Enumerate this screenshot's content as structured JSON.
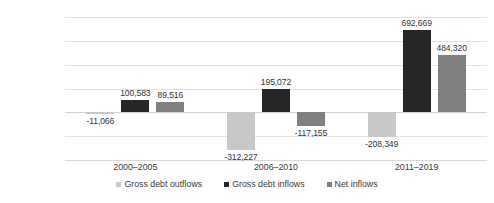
{
  "chart_data": {
    "type": "bar",
    "title": "",
    "subtitle": "",
    "xlabel": "",
    "ylabel": "",
    "categories": [
      "2000–2005",
      "2006–2010",
      "2011–2019"
    ],
    "series": [
      {
        "name": "Gross debt outflows",
        "color": "#c8c8c8",
        "values": [
          -11066,
          -312227,
          -208349
        ],
        "labels": [
          "-11,066",
          "-312,227",
          "-208,349"
        ]
      },
      {
        "name": "Gross debt inflows",
        "color": "#262626",
        "values": [
          100583,
          195072,
          692669
        ],
        "labels": [
          "100,583",
          "195,072",
          "692,669"
        ]
      },
      {
        "name": "Net inflows",
        "color": "#808080",
        "values": [
          89516,
          -117155,
          484320
        ],
        "labels": [
          "89,516",
          "-117,155",
          "484,320"
        ]
      }
    ],
    "ylim": [
      -400000,
      800000
    ],
    "yticks": [
      800000,
      600000,
      400000,
      200000,
      0,
      -200000,
      -400000
    ],
    "ytick_labels": [
      "800,000",
      "600,000",
      "400,000",
      "200,000",
      "0",
      "-200,000",
      "-400,000"
    ],
    "grid": true,
    "legend_position": "bottom"
  },
  "legend": {
    "items": [
      {
        "label": "Gross debt outflows"
      },
      {
        "label": "Gross debt inflows"
      },
      {
        "label": "Net inflows"
      }
    ]
  }
}
